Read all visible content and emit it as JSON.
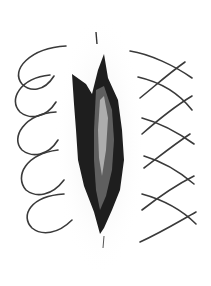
{
  "illustration": {
    "subject": "wound with suture loops",
    "background": "#ffffff",
    "ink": "#2a2a2a",
    "left_sutures": 5,
    "right_sutures": 5
  }
}
